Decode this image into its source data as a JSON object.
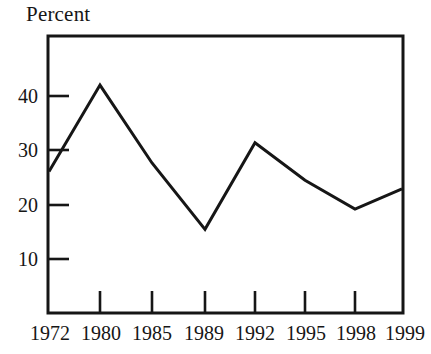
{
  "chart_data": {
    "type": "line",
    "title": "Percent",
    "xlabel": "",
    "ylabel": "",
    "categories": [
      "1972",
      "1980",
      "1985",
      "1989",
      "1992",
      "1995",
      "1998",
      "1999"
    ],
    "values": [
      24.5,
      39.5,
      26,
      14.5,
      29.5,
      23,
      18,
      21.5
    ],
    "series": [
      {
        "name": "Percent",
        "values": [
          24.5,
          39.5,
          26,
          14.5,
          29.5,
          23,
          18,
          21.5
        ]
      }
    ],
    "ylim": [
      0,
      48
    ],
    "yticks": [
      10,
      20,
      30,
      40
    ],
    "ytick_labels": [
      "10",
      "20",
      "30",
      "40"
    ],
    "xtick_labels": [
      "1972",
      "1980",
      "1985",
      "1989",
      "1992",
      "1995",
      "1998",
      "1999"
    ],
    "grid": false,
    "legend": false,
    "legend_position": "none",
    "line_color": "#161616",
    "background_color": "#ffffff",
    "markers": false
  },
  "axes": {
    "y_label_10": "10",
    "y_label_20": "20",
    "y_label_30": "30",
    "y_label_40": "40",
    "x_label_1972": "1972",
    "x_label_1980": "1980",
    "x_label_1985": "1985",
    "x_label_1989": "1989",
    "x_label_1992": "1992",
    "x_label_1995": "1995",
    "x_label_1998": "1998",
    "x_label_1999": "1999"
  }
}
